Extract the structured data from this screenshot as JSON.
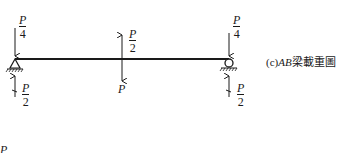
{
  "diagram": {
    "caption_prefix": "(c)",
    "caption_beam": "AB",
    "caption_suffix": "梁載重圖",
    "left_top_load": {
      "num": "P",
      "den": "4"
    },
    "left_reaction": {
      "num": "P",
      "den": "2"
    },
    "mid_up_load": {
      "num": "P",
      "den": "2"
    },
    "mid_down_load": "P",
    "right_top_load": {
      "num": "P",
      "den": "4"
    },
    "right_reaction": {
      "num": "P",
      "den": "2"
    },
    "cut_label": "P"
  }
}
